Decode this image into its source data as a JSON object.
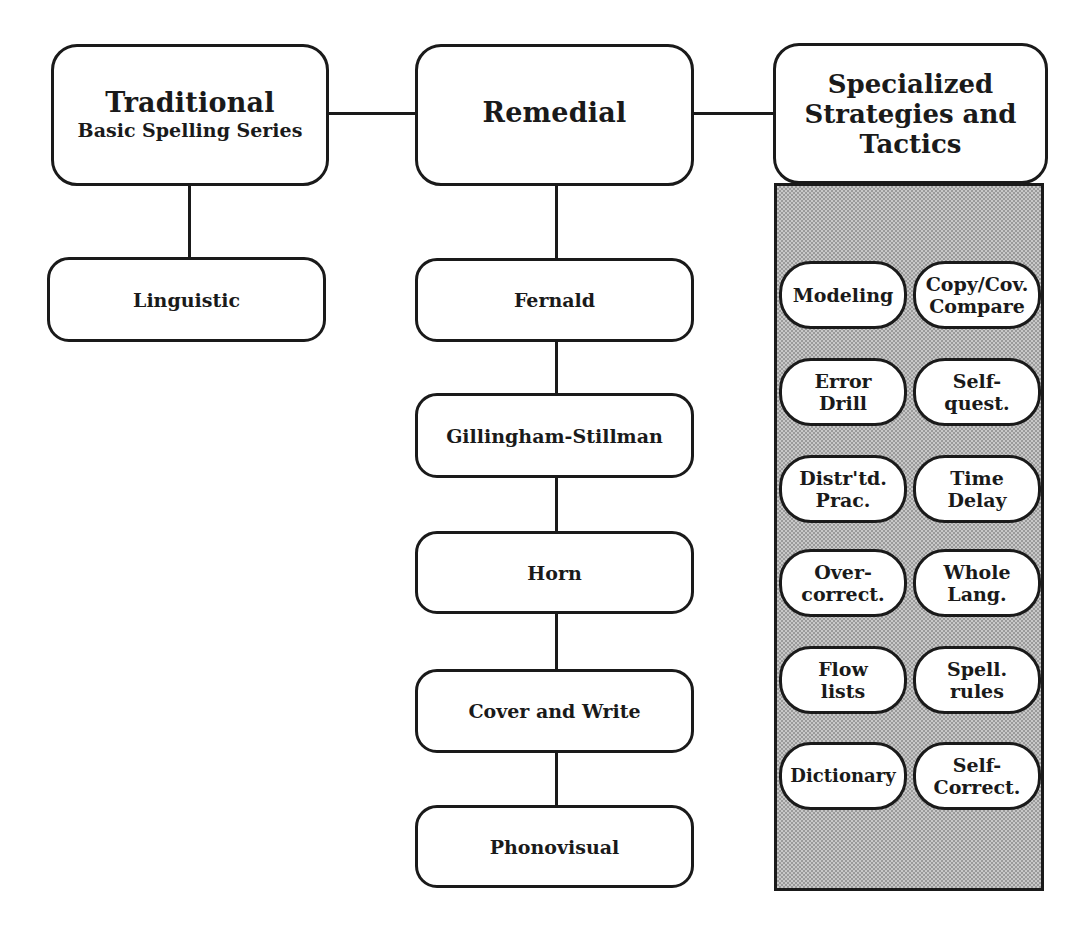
{
  "diagram": {
    "top_row": {
      "traditional": {
        "title": "Traditional",
        "subtitle": "Basic Spelling Series"
      },
      "remedial": {
        "title": "Remedial"
      },
      "specialized": {
        "lines": [
          "Specialized",
          "Strategies and",
          "Tactics"
        ]
      }
    },
    "traditional_children": [
      {
        "label": "Linguistic"
      }
    ],
    "remedial_children": [
      {
        "label": "Fernald"
      },
      {
        "label": "Gillingham-Stillman"
      },
      {
        "label": "Horn"
      },
      {
        "label": "Cover and Write"
      },
      {
        "label": "Phonovisual"
      }
    ],
    "specialized_tactics": [
      {
        "lines": [
          "Modeling"
        ]
      },
      {
        "lines": [
          "Copy/Cov.",
          "Compare"
        ]
      },
      {
        "lines": [
          "Error",
          "Drill"
        ]
      },
      {
        "lines": [
          "Self-",
          "quest."
        ]
      },
      {
        "lines": [
          "Distr'td.",
          "Prac."
        ]
      },
      {
        "lines": [
          "Time",
          "Delay"
        ]
      },
      {
        "lines": [
          "Over-",
          "correct."
        ]
      },
      {
        "lines": [
          "Whole",
          "Lang."
        ]
      },
      {
        "lines": [
          "Flow",
          "lists"
        ]
      },
      {
        "lines": [
          "Spell.",
          "rules"
        ]
      },
      {
        "lines": [
          "Dictionary"
        ]
      },
      {
        "lines": [
          "Self-",
          "Correct."
        ]
      }
    ]
  },
  "colors": {
    "stroke": "#1a1a1a",
    "box_fill": "#ffffff",
    "panel_fill": "#c8c8c8",
    "panel_pattern": "#9a9a9a"
  }
}
